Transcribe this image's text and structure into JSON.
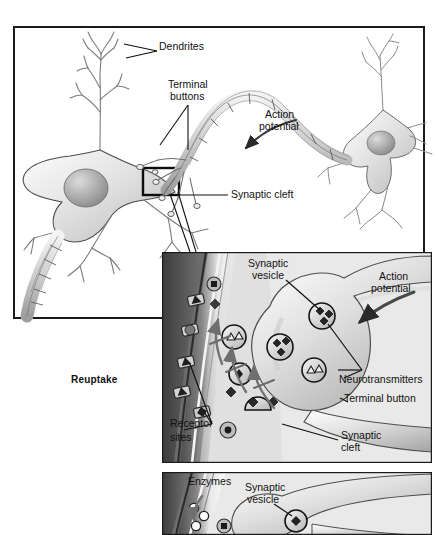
{
  "figure": {
    "type": "biology-illustration"
  },
  "colors": {
    "frame_stroke": "#1a1a1a",
    "page_background": "#ffffff",
    "neuron_fill_light": "#f2f2f2",
    "neuron_fill_mid": "#cfcfcf",
    "neuron_fill_dark": "#9a9a9a",
    "membrane_dark": "#575757",
    "cleft_dark": "#4a4a4a",
    "label_text": "#111111",
    "leader_line": "#111111",
    "vesicle_outline": "#1a1a1a",
    "transmitter_diamond": "#2b2b2b",
    "transmitter_triangle": "#f0f0f0"
  },
  "panels": {
    "overview": {
      "name": "Overview of two neurons",
      "frame": {
        "x": 14,
        "y": 27,
        "w": 410,
        "h": 291
      },
      "labels": [
        {
          "id": "dendrites",
          "text": "Dendrites",
          "x": 159,
          "y": 47,
          "align": "left"
        },
        {
          "id": "terminal_buttons_line1",
          "text": "Terminal",
          "x": 168,
          "y": 85,
          "align": "left"
        },
        {
          "id": "terminal_buttons_line2",
          "text": "buttons",
          "x": 170,
          "y": 97,
          "align": "left"
        },
        {
          "id": "action_potential_line1",
          "text": "Action",
          "x": 265,
          "y": 115,
          "align": "left"
        },
        {
          "id": "action_potential_line2",
          "text": "potential",
          "x": 259,
          "y": 127,
          "align": "left"
        },
        {
          "id": "synaptic_cleft",
          "text": "Synaptic cleft",
          "x": 230,
          "y": 191,
          "align": "left"
        }
      ],
      "zoom_box": {
        "x": 143,
        "y": 168,
        "w": 36,
        "h": 27
      }
    },
    "detail_mid": {
      "name": "Synaptic cleft detail with reuptake",
      "frame": {
        "x": 162,
        "y": 252,
        "w": 270,
        "h": 211
      },
      "labels": [
        {
          "id": "synaptic_vesicle_line1",
          "text": "Synaptic",
          "x": 248,
          "y": 262,
          "align": "left"
        },
        {
          "id": "synaptic_vesicle_line2",
          "text": "vesicle",
          "x": 252,
          "y": 274,
          "align": "left"
        },
        {
          "id": "action_potential_line1",
          "text": "Action",
          "x": 378,
          "y": 275,
          "align": "left"
        },
        {
          "id": "action_potential_line2",
          "text": "potential",
          "x": 370,
          "y": 287,
          "align": "left"
        },
        {
          "id": "neurotransmitters",
          "text": "Neurotransmitters",
          "x": 340,
          "y": 379,
          "align": "left"
        },
        {
          "id": "terminal_button",
          "text": "Terminal button",
          "x": 344,
          "y": 399,
          "align": "left"
        },
        {
          "id": "receptor_sites_line1",
          "text": "Receptor",
          "x": 170,
          "y": 424,
          "align": "left"
        },
        {
          "id": "receptor_sites_line2",
          "text": "sites",
          "x": 170,
          "y": 438,
          "align": "left"
        },
        {
          "id": "synaptic_cleft_line1",
          "text": "Synaptic",
          "x": 341,
          "y": 436,
          "align": "left"
        },
        {
          "id": "synaptic_cleft_line2",
          "text": "cleft",
          "x": 341,
          "y": 448,
          "align": "left"
        }
      ],
      "outside_labels": [
        {
          "id": "reuptake",
          "text": "Reuptake",
          "x": 71,
          "y": 380,
          "bold": true
        }
      ]
    },
    "detail_bottom": {
      "name": "Enzymatic degradation detail",
      "frame": {
        "x": 162,
        "y": 472,
        "w": 270,
        "h": 63
      },
      "labels": [
        {
          "id": "enzymes",
          "text": "Enzymes",
          "x": 188,
          "y": 480,
          "align": "left"
        },
        {
          "id": "synaptic_vesicle_line1",
          "text": "Synaptic",
          "x": 245,
          "y": 486,
          "align": "left"
        },
        {
          "id": "synaptic_vesicle_line2",
          "text": "vesicle",
          "x": 247,
          "y": 498,
          "align": "left"
        }
      ]
    }
  },
  "legend_semantics": {
    "vesicle": "circle containing neurotransmitter molecules",
    "diamond_molecule": "neurotransmitter type A (dark diamond)",
    "triangle_molecule": "neurotransmitter type B (light triangle)",
    "receptor_site": "notch in postsynaptic membrane",
    "reuptake_arrow": "arrow returning transmitter to terminal button",
    "enzyme": "small open circle"
  }
}
